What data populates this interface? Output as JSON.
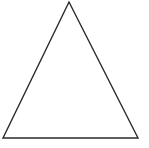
{
  "figure": {
    "shape": "triangle",
    "kind": "equilateral-outline",
    "vertices": {
      "apex": [
        69,
        2
      ],
      "bottom_left": [
        3,
        138
      ],
      "bottom_right": [
        138,
        138
      ]
    },
    "stroke_color": "#2a2a2a",
    "fill_color": "#ffffff",
    "stroke_width": 1.4
  }
}
